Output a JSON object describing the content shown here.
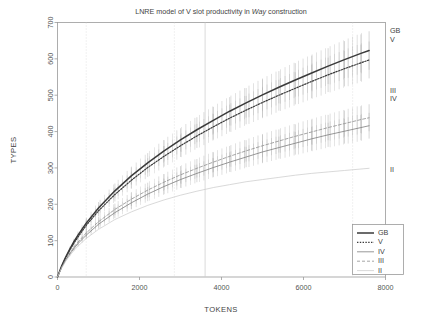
{
  "chart_data": {
    "type": "line",
    "title": "LNRE model of V slot productivity in Way construction",
    "title_italic_word": "Way",
    "xlabel": "TOKENS",
    "ylabel": "TYPES",
    "xlim": [
      0,
      8000
    ],
    "ylim": [
      0,
      700
    ],
    "xticks": [
      0,
      2000,
      4000,
      6000,
      8000
    ],
    "yticks": [
      0,
      100,
      200,
      300,
      400,
      500,
      600,
      700
    ],
    "grid": false,
    "error_bars": true,
    "error_bar_note": "vertical whiskers drawn along GB, V, III and IV curves",
    "legend": {
      "position": "bottom-right-inside",
      "entries": [
        {
          "label": "GB",
          "style": "solid",
          "width": 1.6,
          "color": "#3a3a3a"
        },
        {
          "label": "V",
          "style": "dotted",
          "width": 1.1,
          "color": "#3a3a3a"
        },
        {
          "label": "IV",
          "style": "solid",
          "width": 0.8,
          "color": "#7a7a7a"
        },
        {
          "label": "III",
          "style": "dashed",
          "width": 0.8,
          "color": "#8a8a8a"
        },
        {
          "label": "II",
          "style": "solid",
          "width": 0.6,
          "color": "#c2c2c2"
        }
      ]
    },
    "end_labels": [
      {
        "label": "GB",
        "y_value": 662
      },
      {
        "label": "V",
        "y_value": 634
      },
      {
        "label": "III",
        "y_value": 497
      },
      {
        "label": "IV",
        "y_value": 474
      },
      {
        "label": "II",
        "y_value": 322
      }
    ],
    "vlines": [
      {
        "x": 700,
        "style": "dotted"
      },
      {
        "x": 2850,
        "style": "dotted"
      },
      {
        "x": 3600,
        "style": "solid"
      },
      {
        "x": 7200,
        "style": "dotted"
      }
    ],
    "x": [
      0,
      100,
      200,
      300,
      400,
      500,
      700,
      1000,
      1400,
      1800,
      2200,
      2600,
      3000,
      3400,
      3800,
      4200,
      4600,
      5000,
      5400,
      5800,
      6200,
      6600,
      7000,
      7400,
      7600
    ],
    "series": [
      {
        "name": "GB",
        "style": "solid",
        "values": [
          0,
          30,
          55,
          77,
          97,
          115,
          148,
          190,
          237,
          278,
          314,
          347,
          377,
          405,
          431,
          456,
          479,
          501,
          522,
          542,
          561,
          580,
          598,
          615,
          623
        ]
      },
      {
        "name": "V",
        "style": "dotted",
        "values": [
          0,
          29,
          53,
          74,
          93,
          110,
          142,
          182,
          227,
          266,
          301,
          332,
          361,
          388,
          413,
          437,
          459,
          480,
          500,
          519,
          538,
          556,
          573,
          589,
          597
        ]
      },
      {
        "name": "III",
        "style": "dashed",
        "values": [
          0,
          27,
          48,
          66,
          82,
          96,
          121,
          152,
          186,
          214,
          239,
          261,
          281,
          299,
          316,
          332,
          347,
          361,
          374,
          387,
          399,
          411,
          422,
          433,
          438
        ]
      },
      {
        "name": "IV",
        "style": "solid-thin",
        "values": [
          0,
          26,
          46,
          63,
          78,
          92,
          115,
          145,
          177,
          204,
          228,
          249,
          268,
          285,
          301,
          316,
          330,
          344,
          356,
          368,
          380,
          391,
          401,
          411,
          416
        ]
      },
      {
        "name": "II",
        "style": "solid-faint",
        "values": [
          0,
          24,
          43,
          59,
          73,
          85,
          106,
          131,
          158,
          179,
          197,
          212,
          225,
          236,
          246,
          254,
          262,
          268,
          274,
          280,
          285,
          289,
          293,
          297,
          299
        ]
      }
    ]
  },
  "axes": {
    "x": {
      "label": "TOKENS",
      "tick_labels": [
        "0",
        "2000",
        "4000",
        "6000",
        "8000"
      ]
    },
    "y": {
      "label": "TYPES",
      "tick_labels": [
        "0",
        "100",
        "200",
        "300",
        "400",
        "500",
        "600",
        "700"
      ]
    }
  },
  "title": {
    "prefix": "LNRE model of V slot productivity in ",
    "emphasis": "Way",
    "suffix": " construction"
  },
  "legend": {
    "items": [
      {
        "label": "GB"
      },
      {
        "label": "V"
      },
      {
        "label": "IV"
      },
      {
        "label": "III"
      },
      {
        "label": "II"
      }
    ]
  },
  "end_labels": {
    "gb": "GB",
    "v": "V",
    "iii": "III",
    "iv": "IV",
    "ii": "II"
  },
  "colors": {
    "frame": "#9a9a9a",
    "gb": "#3a3a3a",
    "v": "#3a3a3a",
    "iii": "#8f8f8f",
    "iv": "#7d7d7d",
    "ii": "#c8c8c8",
    "errorbar": "#b8b8b8",
    "vline": "#cfcfcf",
    "text": "#4a4a4a"
  }
}
